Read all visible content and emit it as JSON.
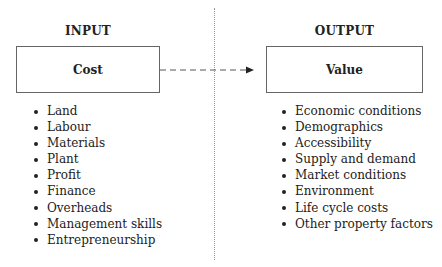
{
  "input": {
    "heading": "INPUT",
    "box_label": "Cost",
    "items": [
      "Land",
      "Labour",
      "Materials",
      "Plant",
      "Profit",
      "Finance",
      "Overheads",
      "Management skills",
      "Entrepreneurship"
    ]
  },
  "output": {
    "heading": "OUTPUT",
    "box_label": "Value",
    "items": [
      "Economic conditions",
      "Demographics",
      "Accessibility",
      "Supply and demand",
      "Market conditions",
      "Environment",
      "Life cycle costs",
      "Other property factors"
    ]
  },
  "connector": {
    "style": "dashed",
    "direction": "cost-to-value",
    "icon": "arrow-right-icon"
  },
  "colors": {
    "line": "#666666",
    "text": "#222222",
    "divider": "#999999"
  }
}
